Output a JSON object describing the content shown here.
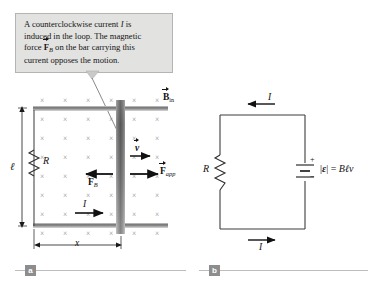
{
  "figure": {
    "callout": {
      "lines": [
        "A counterclockwise current I is",
        "induced in the loop. The magnetic",
        "force F_B on the bar carrying this",
        "current opposes the motion."
      ],
      "line1_a": "A counterclockwise current ",
      "line1_i": "I",
      "line1_b": " is",
      "line2": "induced in the loop. The magnetic",
      "line3_a": "force ",
      "line3_f": "F",
      "line3_sub": "B",
      "line3_b": " on the bar carrying this",
      "line4": "current opposes the motion."
    },
    "panels": [
      {
        "id": "a",
        "label": "a"
      },
      {
        "id": "b",
        "label": "b"
      }
    ],
    "panel_a": {
      "field_symbol": "×",
      "field_label_b": "B",
      "field_label_sub": "in",
      "resistor_label": "R",
      "length_label": "ℓ",
      "distance_label": "x",
      "velocity_label": "v",
      "force_b_label": "F",
      "force_b_sub": "B",
      "force_app_label": "F",
      "force_app_sub": "app",
      "current_label": "I",
      "field_cols": 6,
      "field_rows": 7
    },
    "panel_b": {
      "resistor_label": "R",
      "current_top_label": "I",
      "current_bottom_label": "I",
      "battery_plus": "+",
      "battery_minus": "−",
      "emf_bars": "|",
      "emf_symbol": "ε",
      "emf_equals": "=",
      "emf_b": "B",
      "emf_l": "ℓ",
      "emf_v": "v",
      "emf_expression": "|ε| = Bℓv"
    },
    "colors": {
      "callout_bg": "#e2e2e0",
      "callout_border": "#b4b4b2",
      "rail_dark": "#6e6e6e",
      "rail_light": "#d8d8d8",
      "bar_dark": "#5a5a5a",
      "wire": "#3c3c3c",
      "field_x": "#8a8a8a",
      "tab_bg": "#8d8d8d",
      "rule": "#bdbdbd"
    }
  }
}
